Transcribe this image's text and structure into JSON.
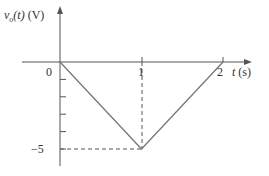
{
  "chart_data": {
    "type": "line",
    "title": "",
    "xlabel": "t (s)",
    "ylabel": "v_o(t) (V)",
    "x": [
      0,
      1,
      2
    ],
    "series": [
      {
        "name": "v_o(t)",
        "values": [
          0,
          -5,
          0
        ]
      }
    ],
    "xlim": [
      0,
      2
    ],
    "ylim": [
      -5,
      0
    ],
    "x_ticks": [
      "0",
      "1",
      "2"
    ],
    "y_ticks": [
      0,
      -1,
      -2,
      -3,
      -4,
      -5
    ],
    "y_tick_labels": [
      "0",
      "-5"
    ],
    "annotations": [
      {
        "type": "dashed-guide",
        "from": [
          1,
          0
        ],
        "to": [
          1,
          -5
        ]
      },
      {
        "type": "dashed-guide",
        "from": [
          0,
          -5
        ],
        "to": [
          1,
          -5
        ]
      }
    ],
    "grid": false,
    "legend": "none"
  },
  "labels": {
    "y_axis_var": "v",
    "y_axis_sub": "o",
    "y_axis_arg": "(t)",
    "y_axis_unit": " (V)",
    "x_axis_var": "t",
    "x_axis_unit": " (s)",
    "tick_0": "0",
    "tick_1": "1",
    "tick_2": "2",
    "tick_m5": "−5"
  },
  "colors": {
    "axis": "#555555",
    "line": "#777777",
    "dash": "#555555",
    "text": "#333333"
  }
}
